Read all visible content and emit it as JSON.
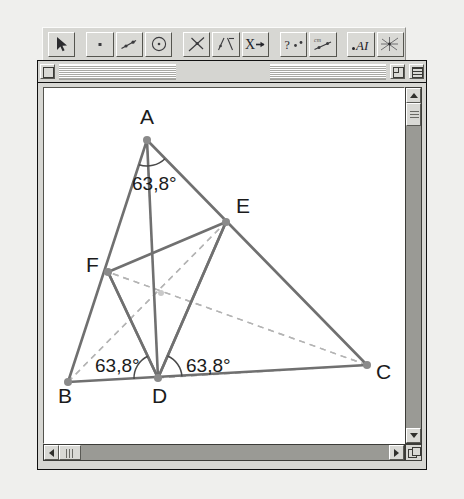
{
  "app": {
    "name": "dynamic-geometry-application"
  },
  "toolbar": {
    "name": "tool-palette",
    "tools": [
      {
        "id": "selection-arrow",
        "label": "Selection Arrow",
        "icon": "arrow-cursor-icon",
        "selected": true
      },
      {
        "id": "point",
        "label": "Point",
        "icon": "point-icon",
        "selected": false
      },
      {
        "id": "segment",
        "label": "Segment",
        "icon": "segment-icon",
        "selected": false
      },
      {
        "id": "circle",
        "label": "Circle",
        "icon": "circle-icon",
        "selected": false
      },
      {
        "id": "perpendicular",
        "label": "Perpendicular Line",
        "icon": "perpendicular-icon",
        "selected": false
      },
      {
        "id": "angle-bisector",
        "label": "Angle Bisector",
        "icon": "angle-bisector-icon",
        "selected": false
      },
      {
        "id": "transform",
        "label": "Transform",
        "icon": "x-arrow-icon",
        "glyph": "X→",
        "selected": false
      },
      {
        "id": "measure",
        "label": "Measure",
        "icon": "measure-icon",
        "glyph": "?",
        "selected": false
      },
      {
        "id": "calculate",
        "label": "Calculate",
        "icon": "calculate-icon",
        "selected": false
      },
      {
        "id": "text-label",
        "label": "Text Label",
        "icon": "text-a-icon",
        "glyph": "A",
        "selected": false
      },
      {
        "id": "macro",
        "label": "Macro Construction",
        "icon": "macro-icon",
        "selected": false
      }
    ]
  },
  "window": {
    "title": "",
    "close_box": "close-box",
    "zoom_box": "zoom-box",
    "collapse_box": "collapse-box"
  },
  "scrollbars": {
    "vertical": {
      "up": "scroll-up",
      "down": "scroll-down",
      "thumb_position_pct": 2
    },
    "horizontal": {
      "left": "scroll-left",
      "right": "scroll-right",
      "thumb_position_pct": 0
    },
    "grow_box": "resize-grow-box"
  },
  "figure": {
    "colors": {
      "solid_line": "#707070",
      "dashed_line": "#b4b4b4",
      "point": "#8a8a8a",
      "label": "#1b1b1b",
      "arc": "#4a4a4a",
      "canvas": "#ffffff"
    },
    "points": [
      {
        "id": "A",
        "label": "A",
        "x": 147,
        "y": 140,
        "label_x": 140,
        "label_y": 124
      },
      {
        "id": "B",
        "label": "B",
        "x": 68,
        "y": 382,
        "label_x": 58,
        "label_y": 403
      },
      {
        "id": "C",
        "label": "C",
        "x": 367,
        "y": 365,
        "label_x": 376,
        "label_y": 379
      },
      {
        "id": "D",
        "label": "D",
        "x": 158,
        "y": 378,
        "label_x": 152,
        "label_y": 403
      },
      {
        "id": "E",
        "label": "E",
        "x": 226,
        "y": 222,
        "label_x": 236,
        "label_y": 213
      },
      {
        "id": "F",
        "label": "F",
        "x": 108,
        "y": 272,
        "label_x": 86,
        "label_y": 272
      },
      {
        "id": "G",
        "label": "",
        "x": 161,
        "y": 293,
        "label_x": 0,
        "label_y": 0
      }
    ],
    "solid_segments": [
      {
        "from": "A",
        "to": "B"
      },
      {
        "from": "B",
        "to": "C"
      },
      {
        "from": "C",
        "to": "A"
      },
      {
        "from": "D",
        "to": "E"
      },
      {
        "from": "E",
        "to": "F"
      },
      {
        "from": "F",
        "to": "D"
      }
    ],
    "dashed_segments": [
      {
        "from": "A",
        "to": "D"
      },
      {
        "from": "B",
        "to": "E"
      },
      {
        "from": "C",
        "to": "F"
      },
      {
        "from": "F",
        "to": "E"
      },
      {
        "from": "D",
        "to": "C"
      },
      {
        "from": "E",
        "to": "D"
      }
    ],
    "angle_measurements": [
      {
        "id": "angle-at-A",
        "value": "63,8°",
        "x": 132,
        "y": 190,
        "vertex": "A"
      },
      {
        "id": "angle-at-D-left",
        "value": "63,8°",
        "x": 95,
        "y": 372,
        "vertex": "D"
      },
      {
        "id": "angle-at-D-right",
        "value": "63,8°",
        "x": 186,
        "y": 372,
        "vertex": "D"
      }
    ],
    "angle_value": "63,8°"
  }
}
